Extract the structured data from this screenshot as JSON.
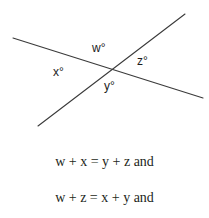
{
  "figure": {
    "kind": "geometry-diagram",
    "background_color": "#ffffff",
    "stroke_color": "#3a3a3a",
    "text_color": "#231f20",
    "label_color": "#1c1c1c",
    "width": 209,
    "height": 218
  },
  "diagram": {
    "intersection": {
      "x": 109,
      "y": 69
    },
    "lines": [
      {
        "name": "descending-line",
        "x1": 13,
        "y1": 38,
        "x2": 203,
        "y2": 98
      },
      {
        "name": "ascending-line",
        "x1": 38,
        "y1": 126,
        "x2": 185,
        "y2": 14
      }
    ],
    "angle_labels": [
      {
        "id": "w",
        "text": "w°",
        "position": "top",
        "x": 92,
        "y": 42
      },
      {
        "id": "x",
        "text": "x°",
        "position": "left",
        "x": 53,
        "y": 66
      },
      {
        "id": "z",
        "text": "z°",
        "position": "right",
        "x": 137,
        "y": 55
      },
      {
        "id": "y",
        "text": "y°",
        "position": "bottom",
        "x": 104,
        "y": 80
      }
    ]
  },
  "equations": {
    "line_1": "w + x = y + z and",
    "line_2": "w + z = x + y and"
  }
}
